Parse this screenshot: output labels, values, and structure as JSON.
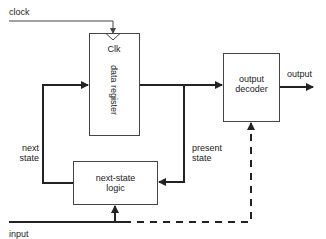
{
  "diagram": {
    "type": "block-diagram",
    "signals": {
      "clock": "clock",
      "input": "input",
      "output": "output",
      "next_state": [
        "next",
        "state"
      ],
      "present_state": [
        "present",
        "state"
      ]
    },
    "blocks": {
      "data_register": {
        "label": "data register",
        "clk_label": "Clk"
      },
      "output_decoder": {
        "label_line1": "output",
        "label_line2": "decoder"
      },
      "next_state_logic": {
        "label_line1": "next-state",
        "label_line2": "logic"
      }
    },
    "colors": {
      "stroke": "#222222",
      "thin_stroke": "#444444",
      "background": "#ffffff"
    }
  }
}
